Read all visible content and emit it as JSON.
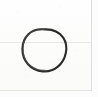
{
  "canvas": {
    "width": 98,
    "height": 97,
    "background_color": "#fdfdfc",
    "paper_tint": "#fcfcfb",
    "description": "Scanned notebook fragment showing a single hand-drawn circle"
  },
  "ink": {
    "stroke_color": "#2b2b2b",
    "stroke_color_light": "#4a4a48",
    "stroke_width": 2.1,
    "shape_name": "hand-drawn-circle",
    "bounds": {
      "left": 22,
      "top": 29,
      "right": 66,
      "bottom": 72
    },
    "center": {
      "x": 44,
      "y": 50
    },
    "radius_x": 22,
    "radius_y": 21
  },
  "rulings": {
    "horizontal": [
      {
        "name": "rule-h-mid",
        "y": 42,
        "color": "#e9e9e7"
      },
      {
        "name": "rule-h-low",
        "y": 90,
        "color": "#e4e4e2"
      }
    ],
    "vertical": [
      {
        "name": "rule-v-right",
        "x": 91,
        "color": "#dedede"
      }
    ]
  },
  "labels": {
    "alt_text": "A single closed circle drawn freehand in dark pencil on off-white paper"
  }
}
